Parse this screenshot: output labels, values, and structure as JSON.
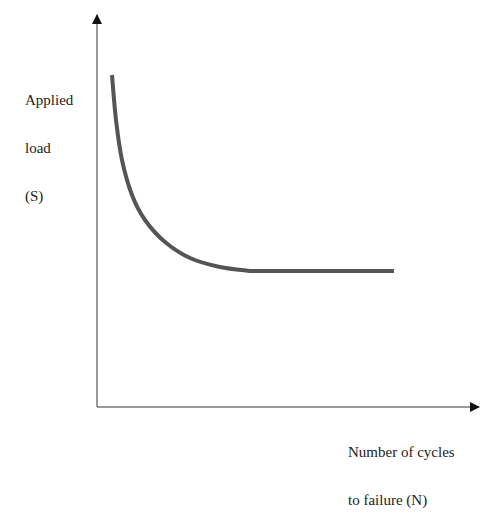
{
  "chart_data": {
    "type": "line",
    "title": "",
    "xlabel": "Number of cycles to failure (N)",
    "ylabel": "Applied load (S)",
    "xlabel_lines": [
      "Number of cycles",
      "to failure (N)"
    ],
    "ylabel_lines": [
      "Applied",
      "load",
      "(S)"
    ],
    "grid": false,
    "legend": null,
    "ticks": false,
    "series": [
      {
        "name": "S-N curve",
        "description": "Applied load decreases steeply with number of cycles, then levels off at a constant endurance limit",
        "color": "#555555",
        "points_px": [
          [
            112,
            75
          ],
          [
            116,
            120
          ],
          [
            122,
            160
          ],
          [
            132,
            195
          ],
          [
            145,
            220
          ],
          [
            165,
            242
          ],
          [
            190,
            258
          ],
          [
            220,
            267
          ],
          [
            250,
            271
          ],
          [
            394,
            271
          ]
        ],
        "x_normalized": [
          0.04,
          0.05,
          0.07,
          0.09,
          0.13,
          0.18,
          0.24,
          0.32,
          0.4,
          0.77
        ],
        "y_normalized": [
          0.84,
          0.73,
          0.63,
          0.54,
          0.48,
          0.42,
          0.38,
          0.36,
          0.35,
          0.35
        ]
      }
    ],
    "axes": {
      "origin_px": [
        97,
        407
      ],
      "x_end_px": [
        481,
        407
      ],
      "y_end_px": [
        97,
        13
      ],
      "axis_color": "#777777"
    }
  }
}
